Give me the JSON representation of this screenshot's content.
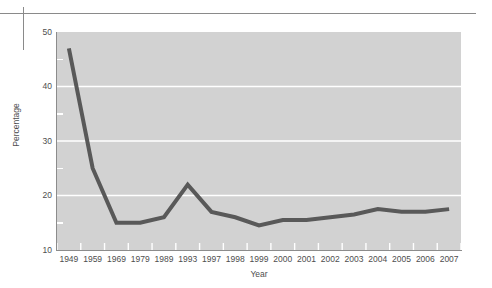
{
  "chart_data": {
    "type": "line",
    "title": "",
    "subtitle": "",
    "xlabel": "Year",
    "ylabel": "Percentage",
    "categories": [
      "1949",
      "1959",
      "1969",
      "1979",
      "1989",
      "1993",
      "1997",
      "1998",
      "1999",
      "2000",
      "2001",
      "2002",
      "2003",
      "2004",
      "2005",
      "2006",
      "2007"
    ],
    "series": [
      {
        "name": "Percentage",
        "values": [
          47,
          25,
          15,
          15,
          16,
          22,
          17,
          16,
          14.5,
          15.5,
          15.5,
          16,
          16.5,
          17.5,
          17,
          17,
          17.5
        ]
      }
    ],
    "ylim": [
      10,
      50
    ],
    "ytick_labels": [
      "10",
      "20",
      "30",
      "40",
      "50"
    ],
    "ytick_values": [
      10,
      20,
      30,
      40,
      50
    ],
    "yminor_values": [
      15,
      25,
      35,
      45
    ],
    "grid": "horizontal-major-white",
    "legend": "none",
    "line_color": "#595959",
    "plot_background": "#d2d2d2",
    "gridline_color": "#ffffff",
    "axis_color": "#8c8c8c",
    "text_color": "#4e4e4e"
  },
  "decor": {
    "top_rule": "horizontal-rule",
    "left_rule": "vertical-rule"
  }
}
